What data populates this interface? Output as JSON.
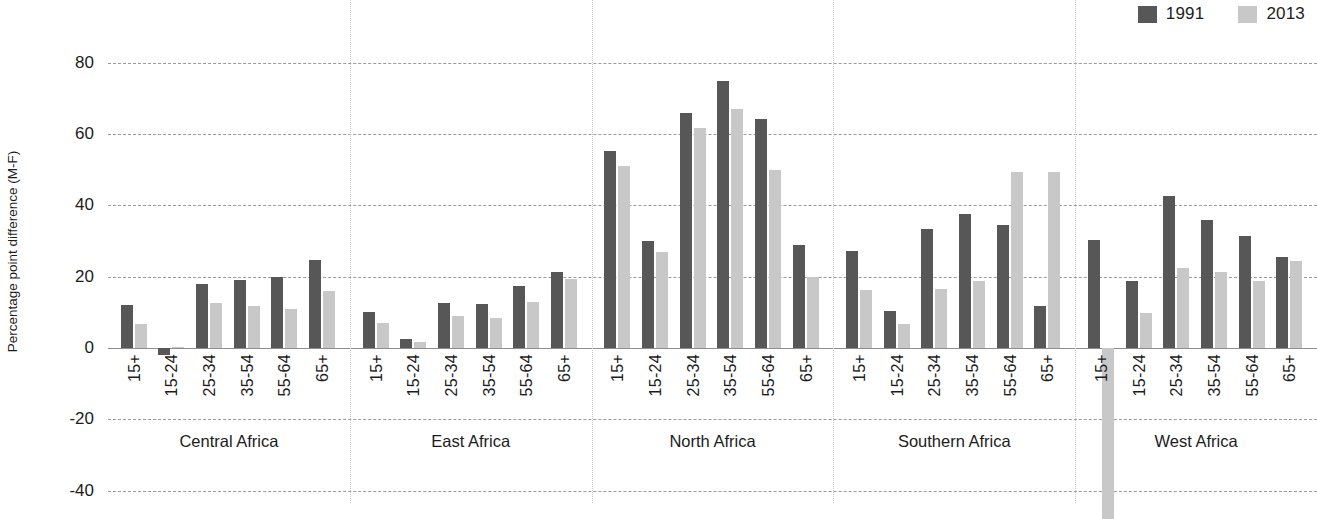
{
  "legend": {
    "items": [
      {
        "label": "1991",
        "color": "#575757",
        "icon": "legend-swatch-1991"
      },
      {
        "label": "2013",
        "color": "#c8c8c8",
        "icon": "legend-swatch-2013"
      }
    ]
  },
  "axis": {
    "y_title": "Percentage point difference (M-F)",
    "ticks": [
      "80",
      "60",
      "40",
      "20",
      "0",
      "-20",
      "-40"
    ]
  },
  "chart_data": {
    "type": "bar",
    "title": "",
    "subtitle": "",
    "xlabel": "",
    "ylabel": "Percentage point difference (M-F)",
    "ylim": [
      -40,
      80
    ],
    "yticks": [
      80,
      60,
      40,
      20,
      0,
      -20,
      -40
    ],
    "grid": true,
    "legend_position": "top-right",
    "grouping": "region then age band",
    "categories": [
      "15+",
      "15-24",
      "25-34",
      "35-54",
      "55-64",
      "65+"
    ],
    "groups": [
      {
        "name": "Central Africa",
        "series": [
          {
            "name": "1991",
            "values": [
              12.0,
              -2.0,
              18.0,
              19.0,
              20.0,
              24.8
            ]
          },
          {
            "name": "2013",
            "values": [
              6.6,
              0.3,
              12.5,
              11.8,
              11.0,
              16.0
            ]
          }
        ]
      },
      {
        "name": "East Africa",
        "series": [
          {
            "name": "1991",
            "values": [
              10.0,
              2.6,
              12.6,
              12.3,
              17.3,
              21.2
            ]
          },
          {
            "name": "2013",
            "values": [
              7.1,
              1.8,
              9.0,
              8.3,
              13.0,
              19.4
            ]
          }
        ]
      },
      {
        "name": "North Africa",
        "series": [
          {
            "name": "1991",
            "values": [
              55.2,
              30.0,
              65.8,
              75.0,
              64.2,
              29.0
            ]
          },
          {
            "name": "2013",
            "values": [
              51.0,
              27.0,
              61.8,
              67.0,
              49.8,
              20.0
            ]
          }
        ]
      },
      {
        "name": "Southern Africa",
        "series": [
          {
            "name": "1991",
            "values": [
              27.2,
              10.4,
              33.4,
              37.5,
              34.5,
              11.8
            ]
          },
          {
            "name": "2013",
            "values": [
              16.4,
              6.6,
              16.6,
              18.7,
              49.3,
              49.3
            ]
          }
        ]
      },
      {
        "name": "West Africa",
        "series": [
          {
            "name": "1991",
            "values": [
              30.3,
              18.8,
              42.5,
              35.8,
              31.5,
              25.4
            ]
          },
          {
            "name": "2013",
            "values": [
              -48.0,
              9.7,
              22.4,
              21.2,
              18.8,
              24.4
            ]
          }
        ]
      }
    ]
  }
}
